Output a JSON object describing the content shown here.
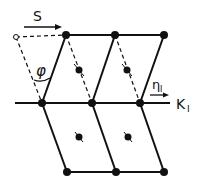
{
  "diagram": {
    "labels": {
      "shear_direction": "S",
      "angle": "φ",
      "direction": "η",
      "direction_sub": "I",
      "plane": "K",
      "plane_sub": "I"
    },
    "colors": {
      "stroke": "#111111",
      "background": "#ffffff"
    },
    "lattice": {
      "top_row": [
        [
          66,
          35
        ],
        [
          115,
          35
        ],
        [
          164,
          35
        ]
      ],
      "middle_row": [
        [
          42,
          103
        ],
        [
          92,
          103
        ],
        [
          140,
          103
        ]
      ],
      "bottom_row": [
        [
          67,
          172
        ],
        [
          116,
          172
        ],
        [
          164,
          172
        ]
      ],
      "centers": [
        [
          79,
          70
        ],
        [
          127,
          70
        ],
        [
          79,
          137
        ],
        [
          128,
          137
        ]
      ],
      "original_site": [
        16,
        37
      ]
    }
  }
}
